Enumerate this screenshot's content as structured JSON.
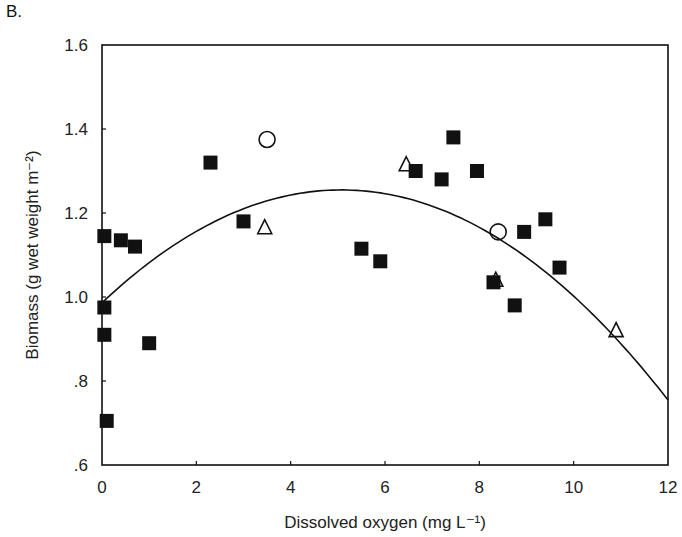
{
  "panel_label": "B.",
  "chart_data": {
    "type": "scatter",
    "title": "",
    "xlabel": "Dissolved oxygen (mg L⁻¹)",
    "ylabel": "Biomass (g wet weight m⁻²)",
    "xlim": [
      0,
      12
    ],
    "ylim": [
      0.6,
      1.6
    ],
    "x_ticks": [
      "0",
      "2",
      "4",
      "6",
      "8",
      "10",
      "12"
    ],
    "y_ticks": [
      ".6",
      ".8",
      "1.0",
      "1.2",
      "1.4",
      "1.6"
    ],
    "grid": false,
    "legend": null,
    "series": [
      {
        "name": "filled squares",
        "marker": "square-filled",
        "points": [
          [
            0.05,
            1.145
          ],
          [
            0.05,
            0.975
          ],
          [
            0.05,
            0.91
          ],
          [
            0.1,
            0.705
          ],
          [
            0.4,
            1.135
          ],
          [
            0.7,
            1.12
          ],
          [
            1.0,
            0.89
          ],
          [
            2.3,
            1.32
          ],
          [
            3.0,
            1.18
          ],
          [
            5.5,
            1.115
          ],
          [
            5.9,
            1.085
          ],
          [
            6.65,
            1.3
          ],
          [
            7.2,
            1.28
          ],
          [
            7.45,
            1.38
          ],
          [
            7.95,
            1.3
          ],
          [
            8.3,
            1.035
          ],
          [
            8.75,
            0.98
          ],
          [
            8.95,
            1.155
          ],
          [
            9.4,
            1.185
          ],
          [
            9.7,
            1.07
          ]
        ]
      },
      {
        "name": "open circles",
        "marker": "circle-open",
        "points": [
          [
            3.5,
            1.375
          ],
          [
            8.4,
            1.155
          ]
        ]
      },
      {
        "name": "open triangles",
        "marker": "triangle-open",
        "points": [
          [
            3.45,
            1.165
          ],
          [
            6.45,
            1.315
          ],
          [
            8.35,
            1.04
          ],
          [
            10.9,
            0.92
          ]
        ]
      },
      {
        "name": "quadratic fit",
        "marker": "line",
        "points": [
          [
            0,
            0.985
          ],
          [
            1,
            1.08
          ],
          [
            2,
            1.155
          ],
          [
            3,
            1.21
          ],
          [
            4,
            1.245
          ],
          [
            5,
            1.26
          ],
          [
            6,
            1.25
          ],
          [
            7,
            1.22
          ],
          [
            8,
            1.165
          ],
          [
            9,
            1.09
          ],
          [
            10,
            0.99
          ],
          [
            11,
            0.88
          ],
          [
            12,
            0.77
          ]
        ]
      }
    ]
  }
}
